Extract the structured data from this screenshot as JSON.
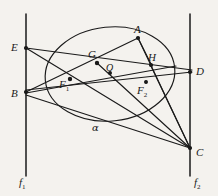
{
  "figure": {
    "type": "euclidean-geometry-diagram",
    "background_color": "#f4f2ee",
    "stroke_color": "#1a1a1a",
    "labels": {
      "ellipse": "α",
      "center": "O",
      "focus_left": "F",
      "focus_left_sub": "1",
      "focus_right": "F",
      "focus_right_sub": "2",
      "point_a": "A",
      "point_g": "G",
      "point_h": "H",
      "point_e": "E",
      "point_b": "B",
      "point_d": "D",
      "point_c": "C",
      "line_left": "f",
      "line_left_sub": "1",
      "line_right": "f",
      "line_right_sub": "2"
    },
    "points": {
      "E": {
        "x": 26,
        "y": 48
      },
      "B": {
        "x": 26,
        "y": 92
      },
      "D": {
        "x": 190,
        "y": 72
      },
      "C": {
        "x": 190,
        "y": 148
      },
      "A": {
        "x": 138,
        "y": 38
      },
      "G": {
        "x": 97,
        "y": 63
      },
      "O": {
        "x": 110,
        "y": 73
      },
      "H": {
        "x": 150,
        "y": 64
      },
      "F1": {
        "x": 70,
        "y": 80
      },
      "F2": {
        "x": 146,
        "y": 83
      }
    },
    "ellipse_geometry": {
      "cx": 110,
      "cy": 74,
      "rx": 65,
      "ry": 48,
      "rotation_deg": -6
    },
    "directrix_left": {
      "x": 26,
      "y1": 14,
      "y2": 176
    },
    "directrix_right": {
      "x": 190,
      "y1": 14,
      "y2": 176
    },
    "segments": [
      {
        "name": "E-H",
        "from": "E",
        "to": "H"
      },
      {
        "name": "E-C",
        "from": "E",
        "to": "C"
      },
      {
        "name": "B-A",
        "from": "B",
        "to": "A"
      },
      {
        "name": "B-D",
        "from": "B",
        "to": "D"
      },
      {
        "name": "B-C",
        "from": "B",
        "to": "C"
      },
      {
        "name": "A-G-B",
        "from": "A",
        "to": "B"
      },
      {
        "name": "A-C",
        "from": "A",
        "to": "C"
      },
      {
        "name": "H-C",
        "from": "H",
        "to": "C"
      },
      {
        "name": "G-C",
        "from": "G",
        "to": "C"
      }
    ]
  }
}
